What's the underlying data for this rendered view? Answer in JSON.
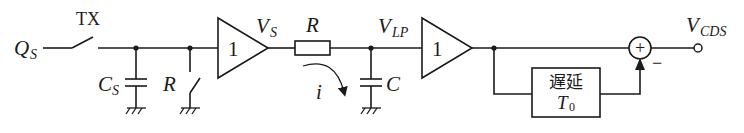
{
  "diagram": {
    "type": "circuit-block-diagram",
    "colors": {
      "line": "#1a1a1a",
      "background": "#ffffff"
    },
    "input": {
      "label_main": "Q",
      "label_sub": "S"
    },
    "transfer_switch": {
      "label": "TX"
    },
    "sense_cap": {
      "label_main": "C",
      "label_sub": "S"
    },
    "reset_switch": {
      "label": "R"
    },
    "buffer1": {
      "gain": "1"
    },
    "buffer1_output": {
      "label_main": "V",
      "label_sub": "S"
    },
    "resistor": {
      "label": "R"
    },
    "current": {
      "label": "i"
    },
    "lowpass_node": {
      "label_main": "V",
      "label_sub": "LP"
    },
    "filter_cap": {
      "label": "C"
    },
    "buffer2": {
      "gain": "1"
    },
    "delay_block": {
      "line1": "遅延",
      "line2_main": "T",
      "line2_sub": "0"
    },
    "summer": {
      "plus_sign": "+",
      "minus_sign": "−"
    },
    "output": {
      "label_main": "V",
      "label_sub": "CDS"
    }
  }
}
